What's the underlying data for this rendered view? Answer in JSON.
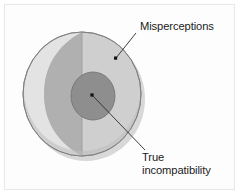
{
  "figure": {
    "type": "concentric-sphere-diagram",
    "background_color": "#ffffff",
    "frame_color": "#e8e8e8",
    "labels": {
      "outer": "Misperceptions",
      "inner": "True\nincompatibility"
    },
    "regions": [
      {
        "name": "outer-sphere",
        "label": "Misperceptions",
        "fill_color": "#cfcfcf",
        "outline_color": "#7d7d7d",
        "shape": "circle"
      },
      {
        "name": "left-rim-highlight",
        "label": "",
        "fill_color": "#e2e2e2",
        "outline_color": "#9a9a9a",
        "shape": "crescent"
      },
      {
        "name": "mid-shading-band",
        "label": "",
        "fill_color": "#b0b0b0",
        "outline_color": "#9a9a9a",
        "shape": "crescent"
      },
      {
        "name": "inner-core",
        "label": "True incompatibility",
        "fill_color": "#8e8e8e",
        "outline_color": "#6f6f6f",
        "shape": "ellipse"
      }
    ],
    "leaders": [
      {
        "name": "leader-misperceptions",
        "from_label": "Misperceptions",
        "to_region": "outer-sphere",
        "dot_color": "#111111",
        "line_color": "#2b2b2b"
      },
      {
        "name": "leader-true-incompatibility",
        "from_label": "True incompatibility",
        "to_region": "inner-core",
        "dot_color": "#111111",
        "line_color": "#2b2b2b"
      }
    ],
    "shadow_color": "#d8d8d8"
  }
}
